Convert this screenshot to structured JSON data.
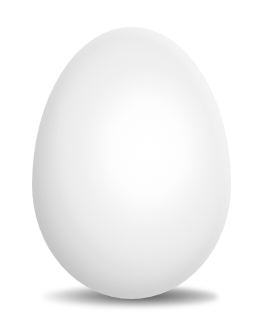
{
  "scene": {
    "subject": "white egg",
    "background_color": "#ffffff",
    "egg_color": "#e8e8e8",
    "highlight_color": "#ffffff",
    "shadow_color": "#2a2a2a"
  }
}
